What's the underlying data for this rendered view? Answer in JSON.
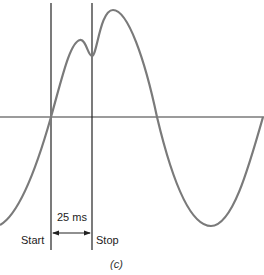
{
  "figure": {
    "caption": "(c)",
    "start_label": "Start",
    "stop_label": "Stop",
    "interval_label": "25 ms"
  },
  "colors": {
    "curve": "#7a7a7a",
    "lines": "#222222",
    "axis": "#7a7a7a"
  }
}
